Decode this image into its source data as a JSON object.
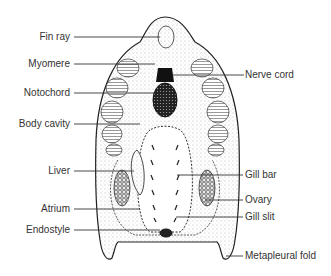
{
  "diagram": {
    "labels_left": [
      {
        "id": "fin-ray",
        "text": "Fin ray",
        "y": 37
      },
      {
        "id": "myomere",
        "text": "Myomere",
        "y": 64
      },
      {
        "id": "notochord",
        "text": "Notochord",
        "y": 93
      },
      {
        "id": "body-cavity",
        "text": "Body cavity",
        "y": 124
      },
      {
        "id": "liver",
        "text": "Liver",
        "y": 171
      },
      {
        "id": "atrium",
        "text": "Atrium",
        "y": 209
      },
      {
        "id": "endostyle",
        "text": "Endostyle",
        "y": 230
      }
    ],
    "labels_right": [
      {
        "id": "nerve-cord",
        "text": "Nerve cord",
        "y": 74
      },
      {
        "id": "gill-bar",
        "text": "Gill bar",
        "y": 175
      },
      {
        "id": "ovary",
        "text": "Ovary",
        "y": 200
      },
      {
        "id": "gill-slit",
        "text": "Gill slit",
        "y": 217
      },
      {
        "id": "metapleural-fold",
        "text": "Metapleural fold",
        "y": 255
      }
    ]
  }
}
